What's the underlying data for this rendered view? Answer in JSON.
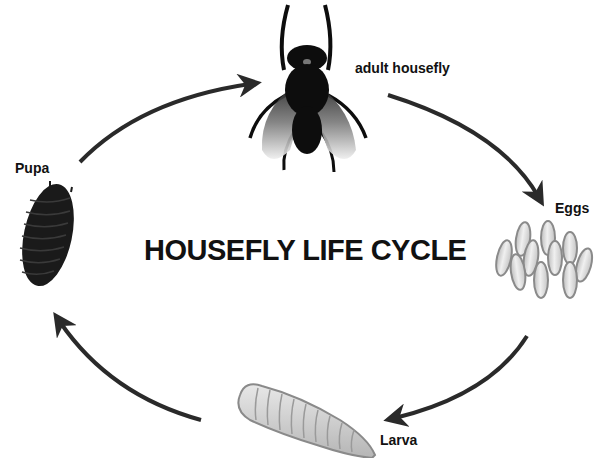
{
  "diagram": {
    "title": "HOUSEFLY LIFE CYCLE",
    "type": "cycle",
    "direction": "clockwise",
    "stages": [
      {
        "id": "adult",
        "label": "adult housefly",
        "icon": "fly-icon"
      },
      {
        "id": "eggs",
        "label": "Eggs",
        "icon": "eggs-icon"
      },
      {
        "id": "larva",
        "label": "Larva",
        "icon": "larva-icon"
      },
      {
        "id": "pupa",
        "label": "Pupa",
        "icon": "pupa-icon"
      }
    ],
    "arrows": [
      {
        "from": "Pupa",
        "to": "adult housefly"
      },
      {
        "from": "adult housefly",
        "to": "Eggs"
      },
      {
        "from": "Eggs",
        "to": "Larva"
      },
      {
        "from": "Larva",
        "to": "Pupa"
      }
    ],
    "colors": {
      "text": "#111111",
      "arrow": "#2a2a2a",
      "fly_body": "#0d0d0d",
      "egg_fill": "#d8d8d8",
      "egg_outline": "#8a8a8a",
      "larva_fill": "#d4d4d4",
      "pupa_fill": "#1a1a1a"
    }
  }
}
